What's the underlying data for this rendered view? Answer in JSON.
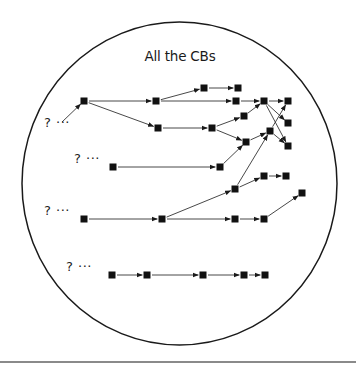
{
  "diagram": {
    "title": "All the CBs",
    "colors": {
      "stroke": "#1a1a1a",
      "edge": "#333333",
      "node": "#111111",
      "rule": "#8a8a8a"
    },
    "boundary": {
      "shape": "ellipse",
      "cx": 179.5,
      "cy": 183.5,
      "rx": 157.5,
      "ry": 161.5
    },
    "unknown_origins": [
      {
        "label": "? ···",
        "x": 44,
        "y": 123
      },
      {
        "label": "? ···",
        "x": 74,
        "y": 159
      },
      {
        "label": "? ···",
        "x": 44,
        "y": 211
      },
      {
        "label": "? ···",
        "x": 66,
        "y": 267
      }
    ],
    "nodes": [
      {
        "id": "n1",
        "x": 84,
        "y": 101
      },
      {
        "id": "n2",
        "x": 156,
        "y": 101
      },
      {
        "id": "n3",
        "x": 158,
        "y": 128
      },
      {
        "id": "n4",
        "x": 204,
        "y": 88
      },
      {
        "id": "n5",
        "x": 238,
        "y": 88
      },
      {
        "id": "n6",
        "x": 236,
        "y": 101
      },
      {
        "id": "n7",
        "x": 264,
        "y": 101
      },
      {
        "id": "n8",
        "x": 288,
        "y": 101
      },
      {
        "id": "n9",
        "x": 212,
        "y": 128
      },
      {
        "id": "n10",
        "x": 244,
        "y": 116
      },
      {
        "id": "n11",
        "x": 246,
        "y": 142
      },
      {
        "id": "n12",
        "x": 270,
        "y": 131
      },
      {
        "id": "n13",
        "x": 288,
        "y": 123
      },
      {
        "id": "n14",
        "x": 288,
        "y": 146
      },
      {
        "id": "n15",
        "x": 113,
        "y": 167
      },
      {
        "id": "n16",
        "x": 220,
        "y": 167
      },
      {
        "id": "n17",
        "x": 84,
        "y": 219
      },
      {
        "id": "n18",
        "x": 162,
        "y": 219
      },
      {
        "id": "n19",
        "x": 235,
        "y": 189
      },
      {
        "id": "n20",
        "x": 264,
        "y": 176
      },
      {
        "id": "n21",
        "x": 286,
        "y": 176
      },
      {
        "id": "n22",
        "x": 235,
        "y": 219
      },
      {
        "id": "n23",
        "x": 264,
        "y": 219
      },
      {
        "id": "n24",
        "x": 302,
        "y": 193
      },
      {
        "id": "n25",
        "x": 112,
        "y": 275
      },
      {
        "id": "n26",
        "x": 147,
        "y": 275
      },
      {
        "id": "n27",
        "x": 203,
        "y": 275
      },
      {
        "id": "n28",
        "x": 244,
        "y": 275
      },
      {
        "id": "n29",
        "x": 265,
        "y": 275
      }
    ],
    "edges": [
      {
        "from": "q0",
        "to": "n1",
        "fx": 62,
        "fy": 122
      },
      {
        "from": "n1",
        "to": "n2"
      },
      {
        "from": "n1",
        "to": "n3"
      },
      {
        "from": "n2",
        "to": "n4"
      },
      {
        "from": "n4",
        "to": "n5"
      },
      {
        "from": "n2",
        "to": "n6"
      },
      {
        "from": "n6",
        "to": "n7"
      },
      {
        "from": "n7",
        "to": "n8"
      },
      {
        "from": "n7",
        "to": "n13"
      },
      {
        "from": "n7",
        "to": "n14"
      },
      {
        "from": "n3",
        "to": "n9"
      },
      {
        "from": "n9",
        "to": "n10"
      },
      {
        "from": "n10",
        "to": "n7"
      },
      {
        "from": "n9",
        "to": "n11"
      },
      {
        "from": "n11",
        "to": "n12"
      },
      {
        "from": "n12",
        "to": "n8"
      },
      {
        "from": "n12",
        "to": "n14"
      },
      {
        "from": "n15",
        "to": "n16"
      },
      {
        "from": "n16",
        "to": "n11"
      },
      {
        "from": "n17",
        "to": "n18"
      },
      {
        "from": "n18",
        "to": "n19"
      },
      {
        "from": "n19",
        "to": "n12"
      },
      {
        "from": "n19",
        "to": "n20"
      },
      {
        "from": "n20",
        "to": "n21"
      },
      {
        "from": "n18",
        "to": "n22"
      },
      {
        "from": "n22",
        "to": "n23"
      },
      {
        "from": "n23",
        "to": "n24"
      },
      {
        "from": "n25",
        "to": "n26"
      },
      {
        "from": "n26",
        "to": "n27"
      },
      {
        "from": "n27",
        "to": "n28"
      },
      {
        "from": "n28",
        "to": "n29"
      }
    ]
  }
}
